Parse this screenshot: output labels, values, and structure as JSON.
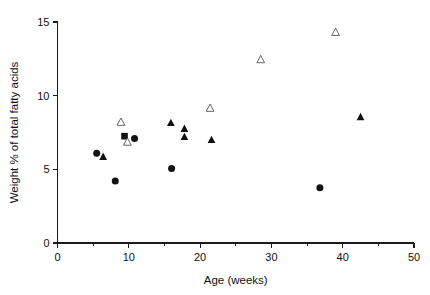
{
  "chart_data": {
    "type": "scatter",
    "title": "",
    "xlabel": "Age (weeks)",
    "ylabel": "Weight % of total fatty acids",
    "xlim": [
      0,
      50
    ],
    "ylim": [
      0,
      15
    ],
    "xticks": [
      0,
      10,
      20,
      30,
      40,
      50
    ],
    "xticklabels": [
      "0",
      "10",
      "20",
      "30",
      "40",
      "50"
    ],
    "xminorticks": [
      5,
      15,
      25,
      35,
      45
    ],
    "yticks": [
      0,
      5,
      10,
      15
    ],
    "yticklabels": [
      "0",
      "5",
      "10",
      "15"
    ],
    "grid": false,
    "legend": "none",
    "series": [
      {
        "name": "filled-circle",
        "marker": "circle",
        "fill": "#111111",
        "points": [
          {
            "x": 5.5,
            "y": 6.1
          },
          {
            "x": 8.1,
            "y": 4.2
          },
          {
            "x": 10.8,
            "y": 7.1
          },
          {
            "x": 16.0,
            "y": 5.05
          },
          {
            "x": 36.8,
            "y": 3.75
          }
        ]
      },
      {
        "name": "filled-triangle",
        "marker": "triangle-up",
        "fill": "#111111",
        "points": [
          {
            "x": 6.4,
            "y": 5.85
          },
          {
            "x": 15.9,
            "y": 8.15
          },
          {
            "x": 17.8,
            "y": 7.75
          },
          {
            "x": 17.8,
            "y": 7.2
          },
          {
            "x": 21.6,
            "y": 7.0
          },
          {
            "x": 42.5,
            "y": 8.55
          }
        ]
      },
      {
        "name": "filled-square",
        "marker": "square",
        "fill": "#111111",
        "points": [
          {
            "x": 9.4,
            "y": 7.25
          }
        ]
      },
      {
        "name": "open-triangle",
        "marker": "triangle-up",
        "fill": "#ffffff",
        "points": [
          {
            "x": 8.9,
            "y": 8.2
          },
          {
            "x": 9.8,
            "y": 6.85
          },
          {
            "x": 21.4,
            "y": 9.15
          },
          {
            "x": 28.5,
            "y": 12.45
          },
          {
            "x": 39.0,
            "y": 14.3
          }
        ]
      }
    ]
  }
}
